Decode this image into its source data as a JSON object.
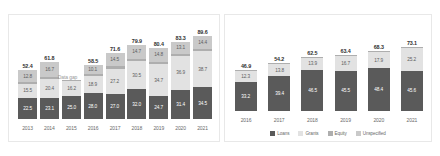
{
  "colors": {
    "loans": "#5a5a5a",
    "grants": "#e2e2e2",
    "equity": "#aeaeae",
    "unspecified": "#c9c9c9",
    "panel_border": "#e8e8e8",
    "background": "#ffffff",
    "axis_text": "#6a6a6a",
    "total_text": "#2f2f2f",
    "annotation_text": "#9a9a9a"
  },
  "legend": {
    "items": [
      {
        "label": "Loans",
        "color": "#5a5a5a"
      },
      {
        "label": "Grants",
        "color": "#e2e2e2"
      },
      {
        "label": "Equity",
        "color": "#aeaeae"
      },
      {
        "label": "Unspecified",
        "color": "#c9c9c9"
      }
    ]
  },
  "left": {
    "annotation": "Data gap",
    "years": [
      "2013",
      "2014",
      "2015",
      "2016",
      "2017",
      "2018",
      "2019",
      "2020",
      "2021"
    ],
    "totals": [
      "52.4",
      "61.8",
      "",
      "58.5",
      "71.6",
      "79.9",
      "80.4",
      "83.3",
      "89.6"
    ],
    "bars": [
      {
        "year": "2013",
        "total": "52.4",
        "segments": [
          {
            "key": "loans",
            "value": "22.5"
          },
          {
            "key": "grants",
            "value": "15.5"
          },
          {
            "key": "equity",
            "value": "1.6"
          },
          {
            "key": "unspecified",
            "value": "12.8"
          }
        ]
      },
      {
        "year": "2014",
        "total": "61.8",
        "segments": [
          {
            "key": "loans",
            "value": "23.1"
          },
          {
            "key": "grants",
            "value": "20.4"
          },
          {
            "key": "equity",
            "value": "1.6"
          },
          {
            "key": "unspecified",
            "value": "16.7"
          }
        ]
      },
      {
        "year": "2015",
        "total": "",
        "segments": [
          {
            "key": "loans",
            "value": "25.0"
          },
          {
            "key": "grants",
            "value": "16.2"
          },
          {
            "key": "equity",
            "value": "0.9"
          },
          {
            "key": "unspecified",
            "value": ""
          }
        ]
      },
      {
        "year": "2016",
        "total": "58.5",
        "segments": [
          {
            "key": "loans",
            "value": "28.0"
          },
          {
            "key": "grants",
            "value": "18.9"
          },
          {
            "key": "equity",
            "value": "1.5"
          },
          {
            "key": "unspecified",
            "value": "10.1"
          }
        ]
      },
      {
        "year": "2017",
        "total": "71.6",
        "segments": [
          {
            "key": "loans",
            "value": "27.0"
          },
          {
            "key": "grants",
            "value": "27.2"
          },
          {
            "key": "equity",
            "value": "2.9"
          },
          {
            "key": "unspecified",
            "value": "14.5"
          }
        ]
      },
      {
        "year": "2018",
        "total": "79.9",
        "segments": [
          {
            "key": "loans",
            "value": "32.0"
          },
          {
            "key": "grants",
            "value": "30.5"
          },
          {
            "key": "equity",
            "value": "2.7"
          },
          {
            "key": "unspecified",
            "value": "14.7"
          }
        ]
      },
      {
        "year": "2019",
        "total": "80.4",
        "segments": [
          {
            "key": "loans",
            "value": "24.7"
          },
          {
            "key": "grants",
            "value": "34.7"
          },
          {
            "key": "equity",
            "value": "2.6"
          },
          {
            "key": "unspecified",
            "value": "14.8"
          }
        ]
      },
      {
        "year": "2020",
        "total": "83.3",
        "segments": [
          {
            "key": "loans",
            "value": "31.4"
          },
          {
            "key": "grants",
            "value": "36.9"
          },
          {
            "key": "equity",
            "value": "1.9"
          },
          {
            "key": "unspecified",
            "value": "13.1"
          }
        ]
      },
      {
        "year": "2021",
        "total": "89.6",
        "segments": [
          {
            "key": "loans",
            "value": "34.5"
          },
          {
            "key": "grants",
            "value": "38.7"
          },
          {
            "key": "equity",
            "value": "2.0"
          },
          {
            "key": "unspecified",
            "value": "14.4"
          }
        ]
      }
    ]
  },
  "right": {
    "years": [
      "2016",
      "2017",
      "2018",
      "2019",
      "2020",
      "2021"
    ],
    "totals": [
      "46.9",
      "54.2",
      "62.5",
      "63.4",
      "68.3",
      "73.1"
    ],
    "bars": [
      {
        "year": "2016",
        "total": "46.9",
        "segments": [
          {
            "key": "loans",
            "value": "33.2"
          },
          {
            "key": "grants",
            "value": "12.3"
          },
          {
            "key": "equity",
            "value": "0.8"
          },
          {
            "key": "unspecified",
            "value": ""
          }
        ]
      },
      {
        "year": "2017",
        "total": "54.2",
        "segments": [
          {
            "key": "loans",
            "value": "39.4"
          },
          {
            "key": "grants",
            "value": "13.8"
          },
          {
            "key": "equity",
            "value": "0.9"
          },
          {
            "key": "unspecified",
            "value": ""
          }
        ]
      },
      {
        "year": "2018",
        "total": "62.5",
        "segments": [
          {
            "key": "loans",
            "value": "46.5"
          },
          {
            "key": "grants",
            "value": "13.9"
          },
          {
            "key": "equity",
            "value": "1.0"
          },
          {
            "key": "unspecified",
            "value": ""
          }
        ]
      },
      {
        "year": "2019",
        "total": "63.4",
        "segments": [
          {
            "key": "loans",
            "value": "45.5"
          },
          {
            "key": "grants",
            "value": "16.7"
          },
          {
            "key": "equity",
            "value": "1.1"
          },
          {
            "key": "unspecified",
            "value": ""
          }
        ]
      },
      {
        "year": "2020",
        "total": "68.3",
        "segments": [
          {
            "key": "loans",
            "value": "48.4"
          },
          {
            "key": "grants",
            "value": "17.9"
          },
          {
            "key": "equity",
            "value": "1.2"
          },
          {
            "key": "unspecified",
            "value": ""
          }
        ]
      },
      {
        "year": "2021",
        "total": "73.1",
        "segments": [
          {
            "key": "loans",
            "value": "45.6"
          },
          {
            "key": "grants",
            "value": "25.2"
          },
          {
            "key": "equity",
            "value": "1.3"
          },
          {
            "key": "unspecified",
            "value": ""
          }
        ]
      }
    ]
  },
  "chart_data": [
    {
      "type": "bar",
      "id": "left-stacked-bar",
      "stacked": true,
      "title": "",
      "xlabel": "",
      "ylabel": "",
      "grid": false,
      "legend_position": "shared-bottom-right",
      "annotations": [
        {
          "text": "Data gap",
          "category": "2015"
        }
      ],
      "categories": [
        "2013",
        "2014",
        "2015",
        "2016",
        "2017",
        "2018",
        "2019",
        "2020",
        "2021"
      ],
      "totals": [
        52.4,
        61.8,
        null,
        58.5,
        71.6,
        79.9,
        80.4,
        83.3,
        89.6
      ],
      "series": [
        {
          "name": "Loans",
          "color": "#5a5a5a",
          "values": [
            22.5,
            23.1,
            25.0,
            28.0,
            27.0,
            32.0,
            24.7,
            31.4,
            34.5
          ]
        },
        {
          "name": "Grants",
          "color": "#e2e2e2",
          "values": [
            15.5,
            20.4,
            16.2,
            18.9,
            27.2,
            30.5,
            34.7,
            36.9,
            38.7
          ]
        },
        {
          "name": "Equity",
          "color": "#aeaeae",
          "values": [
            1.6,
            1.6,
            0.9,
            1.5,
            2.9,
            2.7,
            2.6,
            1.9,
            2.0
          ]
        },
        {
          "name": "Unspecified",
          "color": "#c9c9c9",
          "values": [
            12.8,
            16.7,
            null,
            10.1,
            14.5,
            14.7,
            14.8,
            13.1,
            14.4
          ]
        }
      ]
    },
    {
      "type": "bar",
      "id": "right-stacked-bar",
      "stacked": true,
      "title": "",
      "xlabel": "",
      "ylabel": "",
      "grid": false,
      "legend_position": "bottom",
      "categories": [
        "2016",
        "2017",
        "2018",
        "2019",
        "2020",
        "2021"
      ],
      "totals": [
        46.9,
        54.2,
        62.5,
        63.4,
        68.3,
        73.1
      ],
      "series": [
        {
          "name": "Loans",
          "color": "#5a5a5a",
          "values": [
            33.2,
            39.4,
            46.5,
            45.5,
            48.4,
            45.6
          ]
        },
        {
          "name": "Grants",
          "color": "#e2e2e2",
          "values": [
            12.3,
            13.8,
            13.9,
            16.7,
            17.9,
            25.2
          ]
        },
        {
          "name": "Equity",
          "color": "#aeaeae",
          "values": [
            0.8,
            0.9,
            1.0,
            1.1,
            1.2,
            1.3
          ]
        },
        {
          "name": "Unspecified",
          "color": "#c9c9c9",
          "values": [
            null,
            null,
            null,
            null,
            null,
            null
          ]
        }
      ]
    }
  ]
}
